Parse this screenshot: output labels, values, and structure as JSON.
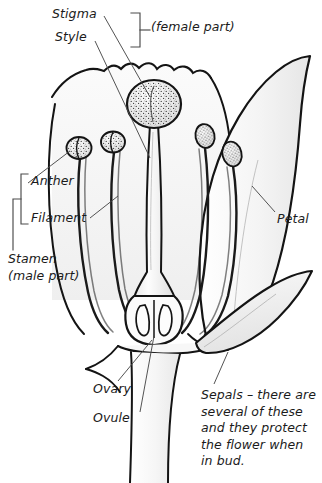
{
  "figure": {
    "background_color": "#ffffff",
    "ink_color": "#1b1b1b",
    "fill_color": "#f1f1f1"
  },
  "labels": {
    "stigma": "Stigma",
    "style": "Style",
    "female_part": "(female part)",
    "anther": "Anther",
    "filament": "Filament",
    "stamen": "Stamen",
    "male_part": "(male part)",
    "petal": "Petal",
    "ovary": "Ovary",
    "ovule": "Ovule",
    "sepals_note": "Sepals – there are several of these and they protect the flower when in bud."
  },
  "parts": [
    {
      "name": "stigma",
      "group": "female",
      "description": "stippled rounded head at top of style"
    },
    {
      "name": "style",
      "group": "female",
      "description": "tapering tube connecting stigma to ovary"
    },
    {
      "name": "ovary",
      "group": "female",
      "description": "swollen base of the carpel"
    },
    {
      "name": "ovule",
      "group": "female",
      "description": "egg cells inside the ovary"
    },
    {
      "name": "anther",
      "group": "male",
      "description": "stippled pollen sac at stamen tip"
    },
    {
      "name": "filament",
      "group": "male",
      "description": "slender stalk supporting the anther"
    },
    {
      "name": "petal",
      "group": "other",
      "description": "large coloured flower leaf"
    },
    {
      "name": "sepal",
      "group": "other",
      "description": "protective leaf below the petals"
    }
  ],
  "brackets": [
    {
      "name": "female-part-bracket",
      "encloses": [
        "Stigma",
        "Style"
      ]
    },
    {
      "name": "anther-filament-bracket",
      "encloses": [
        "Anther",
        "Filament"
      ]
    },
    {
      "name": "stamen-bracket",
      "encloses": [
        "Anther",
        "Filament"
      ]
    }
  ]
}
